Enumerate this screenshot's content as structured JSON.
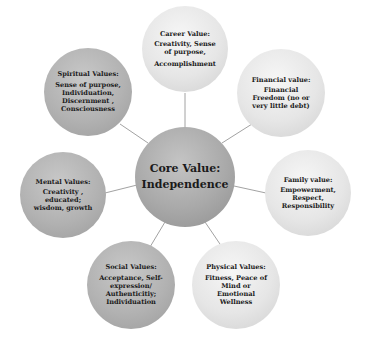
{
  "diagram": {
    "type": "mind-map",
    "center": {
      "title": "Core Value:",
      "body": "Independence"
    },
    "nodes": [
      {
        "id": "career",
        "title": "Career Value:",
        "body": "Creativity, Sense of purpose,",
        "extra": "Accomplishment"
      },
      {
        "id": "financial",
        "title": "Financial value:",
        "body": "Financial  Freedom (no or very little debt)",
        "extra": ""
      },
      {
        "id": "family",
        "title": "Family value:",
        "body": "Empowerment, Respect, Responsibility",
        "extra": ""
      },
      {
        "id": "physical",
        "title": "Physical Values:",
        "body": "Fitness, Peace of Mind or Emotional Wellness",
        "extra": ""
      },
      {
        "id": "social",
        "title": "Social Values:",
        "body": "Acceptance, Self-expression/ Authenticitiy; Individuation",
        "extra": ""
      },
      {
        "id": "mental",
        "title": "Mental Values:",
        "body": "Creativity , educated; wisdom, growth",
        "extra": ""
      },
      {
        "id": "spiritual",
        "title": "Spiritual Values:",
        "body": "Sense of purpose, Individuation, Discernment , Consciousness",
        "extra": ""
      }
    ],
    "colors": {
      "light_node": "#e6e6e6",
      "mid_node": "#b2b2b2",
      "core_node": "#a9a9a9",
      "connector": "#8a8a8a"
    }
  }
}
